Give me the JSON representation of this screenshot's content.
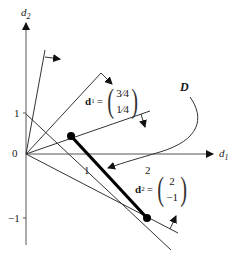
{
  "axes": {
    "x_label": "d",
    "x_sub": "1",
    "y_label": "d",
    "y_sub": "2",
    "origin_label": "0",
    "x_ticks": [
      "1",
      "2"
    ],
    "y_ticks": [
      "1",
      "−1"
    ]
  },
  "region_label": "D",
  "vectors": [
    {
      "name": "d",
      "sup": "1",
      "eq": "=",
      "components": [
        "3⁄4",
        "1⁄4"
      ]
    },
    {
      "name": "d",
      "sup": "2",
      "eq": "=",
      "components": [
        "2",
        "−1"
      ]
    }
  ],
  "points": [
    {
      "label": "extreme point A",
      "coords": [
        0.75,
        0.25
      ]
    },
    {
      "label": "extreme point B",
      "coords": [
        2,
        -1
      ]
    }
  ],
  "colors": {
    "line": "#333333",
    "segment": "#000000"
  }
}
